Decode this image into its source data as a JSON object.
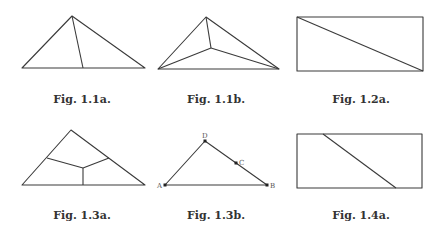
{
  "figures": [
    {
      "id": "fig-1-1a",
      "caption": "Fig. 1.1a.",
      "caption_pos": [
        82,
        93
      ],
      "type": "triangle",
      "vertices": [
        [
          72,
          16
        ],
        [
          22,
          68
        ],
        [
          145,
          68
        ]
      ],
      "inner_segments": [
        [
          [
            72,
            16
          ],
          [
            83,
            68
          ]
        ]
      ]
    },
    {
      "id": "fig-1-1b",
      "caption": "Fig. 1.1b.",
      "caption_pos": [
        216,
        93
      ],
      "type": "triangle",
      "vertices": [
        [
          206,
          17
        ],
        [
          158,
          69
        ],
        [
          279,
          69
        ]
      ],
      "inner_point": [
        211,
        48
      ],
      "inner_segments": [
        [
          [
            206,
            17
          ],
          [
            211,
            48
          ]
        ],
        [
          [
            158,
            69
          ],
          [
            211,
            48
          ]
        ],
        [
          [
            279,
            69
          ],
          [
            211,
            48
          ]
        ]
      ]
    },
    {
      "id": "fig-1-2a",
      "caption": "Fig. 1.2a.",
      "caption_pos": [
        361,
        93
      ],
      "type": "rectangle",
      "rect": [
        297,
        17,
        423,
        71
      ],
      "inner_segments": [
        [
          [
            297,
            17
          ],
          [
            423,
            71
          ]
        ]
      ]
    },
    {
      "id": "fig-1-3a",
      "caption": "Fig. 1.3a.",
      "caption_pos": [
        82,
        209
      ],
      "type": "triangle",
      "vertices": [
        [
          71,
          130
        ],
        [
          22,
          185
        ],
        [
          145,
          185
        ]
      ],
      "inner_point": [
        83,
        168
      ],
      "inner_segments": [
        [
          [
            47,
            158
          ],
          [
            83,
            168
          ]
        ],
        [
          [
            109,
            158
          ],
          [
            83,
            168
          ]
        ],
        [
          [
            83,
            168
          ],
          [
            83,
            185
          ]
        ]
      ]
    },
    {
      "id": "fig-1-3b",
      "caption": "Fig. 1.3b.",
      "caption_pos": [
        216,
        209
      ],
      "type": "triangle-open",
      "path": [
        [
          165,
          185
        ],
        [
          205,
          141
        ],
        [
          267,
          185
        ]
      ],
      "base": [
        [
          165,
          185
        ],
        [
          267,
          185
        ]
      ],
      "points": [
        {
          "label": "A",
          "xy": [
            165,
            185
          ],
          "label_xy": [
            157,
            188
          ]
        },
        {
          "label": "B",
          "xy": [
            267,
            185
          ],
          "label_xy": [
            270,
            188
          ]
        },
        {
          "label": "C",
          "xy": [
            236,
            163
          ],
          "label_xy": [
            239,
            165
          ]
        },
        {
          "label": "D",
          "xy": [
            205,
            141
          ],
          "label_xy": [
            202,
            138
          ]
        }
      ]
    },
    {
      "id": "fig-1-4a",
      "caption": "Fig. 1.4a.",
      "caption_pos": [
        361,
        209
      ],
      "type": "rectangle",
      "rect": [
        297,
        134,
        422,
        188
      ],
      "inner_segments": [
        [
          [
            323,
            134
          ],
          [
            396,
            188
          ]
        ]
      ]
    }
  ]
}
